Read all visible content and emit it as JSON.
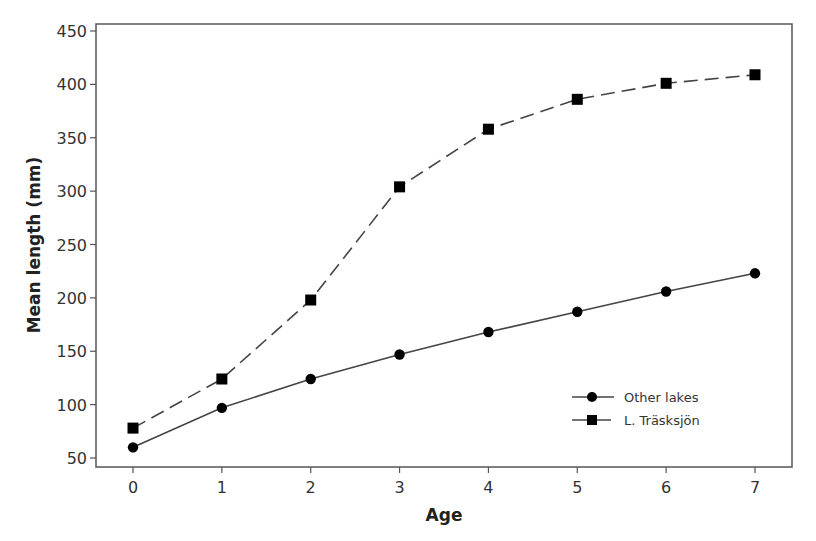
{
  "chart_data": {
    "type": "line",
    "title": "",
    "xlabel": "Age",
    "ylabel": "Mean length (mm)",
    "x": [
      0,
      1,
      2,
      3,
      4,
      5,
      6,
      7
    ],
    "xticks": [
      "0",
      "1",
      "2",
      "3",
      "4",
      "5",
      "6",
      "7"
    ],
    "yticks": [
      "50",
      "100",
      "150",
      "200",
      "250",
      "300",
      "350",
      "400",
      "450"
    ],
    "ylim": [
      40,
      457
    ],
    "xlim": [
      -0.42,
      7.4
    ],
    "grid": false,
    "legend_position": "lower right (inside plot)",
    "series": [
      {
        "name": "Other lakes",
        "marker": "circle",
        "line_style": "solid",
        "color": "#000000",
        "values": [
          60,
          97,
          124,
          147,
          168,
          187,
          206,
          223
        ]
      },
      {
        "name": "L. Träsksjön",
        "marker": "square",
        "line_style": "dashed",
        "color": "#000000",
        "values": [
          78,
          124,
          198,
          304,
          358,
          386,
          401,
          409
        ]
      }
    ]
  }
}
